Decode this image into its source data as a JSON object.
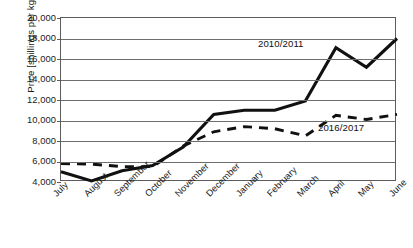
{
  "chart_data": {
    "type": "line",
    "title": "",
    "xlabel": "",
    "ylabel": "Price [shillings per kg]",
    "ylim": [
      4000,
      20000
    ],
    "ytick_step": 2000,
    "yticks": [
      "20,000",
      "18,000",
      "16,000",
      "14,000",
      "12,000",
      "10,000",
      "8,000",
      "6,000",
      "4,000"
    ],
    "ytick_values": [
      20000,
      18000,
      16000,
      14000,
      12000,
      10000,
      8000,
      6000,
      4000
    ],
    "grid": true,
    "grid_axis": "y",
    "legend_position": "inline-annotations",
    "categories": [
      "July",
      "August",
      "September",
      "October",
      "November",
      "December",
      "January",
      "February",
      "March",
      "April",
      "May",
      "June"
    ],
    "series": [
      {
        "name": "2010/2011",
        "style": "solid",
        "color": "#111111",
        "values": [
          5000,
          4100,
          5100,
          5600,
          7400,
          10600,
          11000,
          11000,
          11900,
          17100,
          15200,
          18000
        ]
      },
      {
        "name": "2016/2017",
        "style": "dashed",
        "color": "#111111",
        "values": [
          5800,
          5750,
          5500,
          5500,
          7500,
          8900,
          9400,
          9200,
          8500,
          10500,
          10100,
          10600
        ]
      }
    ],
    "annotations": [
      {
        "text": "2010/2011",
        "series": "2010/2011"
      },
      {
        "text": "2016/2017",
        "series": "2016/2017"
      }
    ]
  },
  "axes": {
    "y_title": "Price [shillings per kg]"
  }
}
